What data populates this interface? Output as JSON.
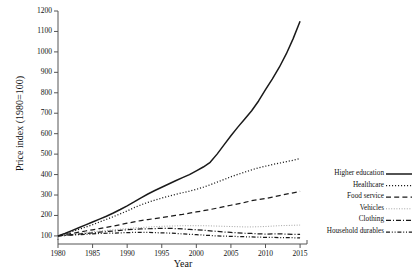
{
  "chart_data": {
    "type": "line",
    "title": "",
    "xlabel": "Year",
    "ylabel": "Price index (1980=100)",
    "xlim": [
      1980,
      2016
    ],
    "ylim": [
      80,
      1200
    ],
    "grid": false,
    "legend_position": "right",
    "xticks": [
      "1980",
      "1985",
      "1990",
      "1995",
      "2000",
      "2005",
      "2010",
      "2015"
    ],
    "xtick_values": [
      1980,
      1985,
      1990,
      1995,
      2000,
      2005,
      2010,
      2015
    ],
    "yticks": [
      "100",
      "200",
      "300",
      "400",
      "500",
      "600",
      "700",
      "800",
      "900",
      "1000",
      "1100",
      "1200"
    ],
    "ytick_values": [
      100,
      200,
      300,
      400,
      500,
      600,
      700,
      800,
      900,
      1000,
      1100,
      1200
    ],
    "x": [
      1980,
      1981,
      1982,
      1983,
      1984,
      1985,
      1986,
      1987,
      1988,
      1989,
      1990,
      1991,
      1992,
      1993,
      1994,
      1995,
      1996,
      1997,
      1998,
      1999,
      2000,
      2001,
      2002,
      2003,
      2004,
      2005,
      2006,
      2007,
      2008,
      2009,
      2010,
      2011,
      2012,
      2013,
      2014,
      2015
    ],
    "series": [
      {
        "name": "Higher education",
        "style": "solid",
        "color": "#1a1a1a",
        "values": [
          100,
          112,
          126,
          140,
          154,
          168,
          182,
          196,
          212,
          229,
          247,
          266,
          286,
          305,
          322,
          338,
          354,
          370,
          385,
          400,
          418,
          437,
          460,
          500,
          545,
          590,
          632,
          672,
          712,
          760,
          815,
          868,
          925,
          990,
          1065,
          1150
        ]
      },
      {
        "name": "Healthcare",
        "style": "dotted",
        "color": "#1a1a1a",
        "values": [
          100,
          110,
          121,
          132,
          143,
          155,
          168,
          181,
          194,
          208,
          222,
          238,
          252,
          264,
          275,
          285,
          294,
          303,
          311,
          319,
          328,
          338,
          350,
          363,
          376,
          389,
          401,
          412,
          423,
          433,
          441,
          449,
          456,
          463,
          470,
          478
        ]
      },
      {
        "name": "Food service",
        "style": "dashed",
        "color": "#1a1a1a",
        "values": [
          100,
          106,
          112,
          118,
          124,
          130,
          136,
          142,
          148,
          155,
          162,
          169,
          175,
          180,
          185,
          190,
          195,
          200,
          205,
          211,
          217,
          223,
          229,
          236,
          243,
          250,
          257,
          264,
          272,
          278,
          283,
          290,
          297,
          304,
          311,
          318
        ]
      },
      {
        "name": "Vehicles",
        "style": "fine-dotted",
        "color": "#9a9a9a",
        "values": [
          100,
          104,
          108,
          112,
          116,
          120,
          124,
          127,
          130,
          133,
          136,
          139,
          141,
          143,
          145,
          147,
          148,
          149,
          150,
          150,
          150,
          150,
          149,
          148,
          147,
          146,
          145,
          144,
          144,
          145,
          146,
          148,
          150,
          151,
          152,
          153
        ]
      },
      {
        "name": "Clothing",
        "style": "dash-dot",
        "color": "#1a1a1a",
        "values": [
          100,
          103,
          106,
          109,
          112,
          115,
          118,
          121,
          124,
          127,
          130,
          132,
          134,
          135,
          136,
          137,
          137,
          136,
          134,
          132,
          130,
          128,
          125,
          122,
          119,
          117,
          115,
          113,
          112,
          110,
          109,
          110,
          110,
          109,
          108,
          107
        ]
      },
      {
        "name": "Household durables",
        "style": "dash-dot-dot",
        "color": "#1a1a1a",
        "values": [
          100,
          102,
          104,
          106,
          108,
          110,
          112,
          113,
          114,
          115,
          116,
          117,
          117,
          117,
          116,
          115,
          114,
          112,
          110,
          108,
          106,
          104,
          102,
          100,
          99,
          98,
          97,
          96,
          95,
          94,
          93,
          93,
          92,
          92,
          91,
          90
        ]
      }
    ]
  },
  "legend": {
    "items": [
      {
        "label": "Higher education"
      },
      {
        "label": "Healthcare"
      },
      {
        "label": "Food service"
      },
      {
        "label": "Vehicles"
      },
      {
        "label": "Clothing"
      },
      {
        "label": "Household durables"
      }
    ]
  }
}
